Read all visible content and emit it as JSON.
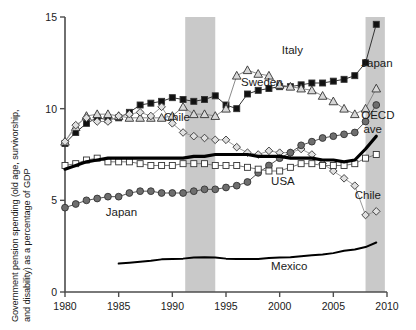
{
  "chart_data": {
    "type": "line",
    "title": "",
    "xlabel": "",
    "ylabel_line1": "Government pension spending (old age, survivorship,",
    "ylabel_line2": "and disability) as a percentage of GDP",
    "ylabel": "Government pension spending (old age, survivorship, and disability) as a percentage of GDP",
    "xlim": [
      1980,
      2010
    ],
    "ylim": [
      0,
      15
    ],
    "xticks": [
      1980,
      1985,
      1990,
      1995,
      2000,
      2005,
      2010
    ],
    "yticks": [
      0,
      5,
      10,
      15
    ],
    "xtick_labels": [
      "1980",
      "1985",
      "1990",
      "1995",
      "2000",
      "2005",
      "2010"
    ],
    "ytick_labels": [
      "0",
      "5",
      "10",
      "15"
    ],
    "grid": false,
    "legend": "inline-annotations",
    "shaded_bands": [
      {
        "label": "recession",
        "x0": 1991.2,
        "x1": 1994.0,
        "color": "#c9c9c9"
      },
      {
        "label": "recession",
        "x0": 2008.0,
        "x1": 2009.8,
        "color": "#c9c9c9"
      }
    ],
    "series": [
      {
        "name": "Italy",
        "marker": "filled-square",
        "marker_color": "#111111",
        "line_color": "#333333",
        "label_x": 2000.2,
        "label_y": 13.0,
        "x": [
          1980,
          1981,
          1982,
          1983,
          1984,
          1985,
          1986,
          1987,
          1988,
          1989,
          1990,
          1991,
          1992,
          1993,
          1994,
          1995,
          1996,
          1997,
          1998,
          1999,
          2000,
          2001,
          2002,
          2003,
          2004,
          2005,
          2006,
          2007,
          2008,
          2009
        ],
        "values": [
          8.1,
          8.7,
          9.2,
          9.5,
          9.4,
          9.5,
          9.8,
          10.2,
          10.3,
          10.4,
          10.6,
          10.5,
          10.4,
          10.5,
          10.7,
          10.2,
          10.0,
          10.8,
          11.0,
          11.1,
          11.2,
          11.2,
          11.3,
          11.4,
          11.4,
          11.5,
          11.6,
          11.8,
          12.5,
          14.6
        ]
      },
      {
        "name": "Sweden",
        "marker": "open-triangle",
        "marker_color": "#d7d7d7",
        "line_color": "#8a8a8a",
        "label_x": 1996.0,
        "label_y": 11.3,
        "x": [
          1980,
          1981,
          1982,
          1983,
          1984,
          1985,
          1986,
          1987,
          1988,
          1989,
          1990,
          1991,
          1992,
          1993,
          1994,
          1995,
          1996,
          1997,
          1998,
          1999,
          2000,
          2001,
          2002,
          2003,
          2004,
          2005,
          2006,
          2007,
          2008,
          2009
        ],
        "values": [
          8.2,
          9.0,
          9.6,
          9.7,
          9.7,
          9.6,
          9.5,
          9.5,
          9.5,
          9.5,
          9.6,
          10.1,
          9.7,
          9.7,
          9.6,
          10.0,
          11.8,
          12.1,
          11.9,
          11.8,
          11.3,
          11.2,
          11.1,
          11.0,
          10.7,
          10.4,
          10.0,
          9.7,
          10.0,
          11.1
        ]
      },
      {
        "name": "Chile",
        "marker": "open-diamond",
        "marker_color": "#e0e0e0",
        "line_color": "#9a9a9a",
        "label_x": 1989.0,
        "label_y": 9.4,
        "x": [
          1980,
          1981,
          1982,
          1983,
          1984,
          1985,
          1986,
          1987,
          1988,
          1989,
          1990,
          1991,
          1992,
          1993,
          1994,
          1995,
          1996,
          1997,
          1998,
          1999,
          2000,
          2001,
          2002,
          2003,
          2004,
          2005,
          2006,
          2007,
          2008,
          2009
        ],
        "values": [
          8.2,
          9.1,
          9.5,
          9.3,
          9.3,
          9.6,
          9.7,
          9.8,
          9.6,
          10.1,
          9.2,
          8.7,
          8.5,
          8.4,
          8.3,
          8.3,
          7.9,
          7.6,
          7.5,
          7.7,
          7.6,
          7.6,
          7.8,
          7.5,
          7.0,
          6.6,
          6.2,
          5.8,
          4.2,
          4.4
        ]
      },
      {
        "name": "Japan",
        "marker": "filled-circle",
        "marker_color": "#6e6e6e",
        "line_color": "#555555",
        "label_x": 1984.5,
        "label_y": 4.1,
        "label2_x": 2008.8,
        "label2_y": 12.0,
        "x": [
          1980,
          1981,
          1982,
          1983,
          1984,
          1985,
          1986,
          1987,
          1988,
          1989,
          1990,
          1991,
          1992,
          1993,
          1994,
          1995,
          1996,
          1997,
          1998,
          1999,
          2000,
          2001,
          2002,
          2003,
          2004,
          2005,
          2006,
          2007,
          2008,
          2009
        ],
        "values": [
          4.6,
          4.8,
          5.0,
          5.1,
          5.2,
          5.2,
          5.4,
          5.5,
          5.5,
          5.4,
          5.4,
          5.4,
          5.5,
          5.6,
          5.6,
          5.7,
          5.8,
          6.0,
          6.5,
          6.9,
          7.3,
          7.6,
          8.0,
          8.2,
          8.4,
          8.5,
          8.6,
          8.7,
          9.3,
          10.2
        ]
      },
      {
        "name": "USA",
        "marker": "open-square",
        "marker_color": "#ffffff",
        "line_color": "#7a7a7a",
        "label_x": 1999.0,
        "label_y": 5.9,
        "x": [
          1980,
          1981,
          1982,
          1983,
          1984,
          1985,
          1986,
          1987,
          1988,
          1989,
          1990,
          1991,
          1992,
          1993,
          1994,
          1995,
          1996,
          1997,
          1998,
          1999,
          2000,
          2001,
          2002,
          2003,
          2004,
          2005,
          2006,
          2007,
          2008,
          2009
        ],
        "values": [
          6.9,
          7.0,
          7.2,
          7.3,
          7.1,
          7.1,
          7.1,
          7.0,
          6.9,
          6.9,
          6.9,
          7.0,
          7.0,
          7.0,
          6.9,
          6.9,
          6.9,
          6.8,
          6.7,
          6.6,
          6.6,
          6.8,
          7.0,
          7.0,
          6.9,
          6.9,
          6.9,
          7.0,
          7.3,
          7.5
        ]
      },
      {
        "name": "OECD ave",
        "marker": "none",
        "marker_color": "#000000",
        "line_color": "#000000",
        "line_width": 3.2,
        "label_x": 2008.6,
        "label_y": 9.2,
        "x": [
          1980,
          1981,
          1982,
          1983,
          1984,
          1985,
          1986,
          1987,
          1988,
          1989,
          1990,
          1991,
          1992,
          1993,
          1994,
          1995,
          1996,
          1997,
          1998,
          1999,
          2000,
          2001,
          2002,
          2003,
          2004,
          2005,
          2006,
          2007,
          2008,
          2009
        ],
        "values": [
          6.7,
          6.9,
          7.1,
          7.2,
          7.3,
          7.3,
          7.3,
          7.3,
          7.3,
          7.3,
          7.3,
          7.3,
          7.4,
          7.4,
          7.5,
          7.5,
          7.5,
          7.5,
          7.4,
          7.4,
          7.4,
          7.3,
          7.3,
          7.3,
          7.2,
          7.2,
          7.1,
          7.2,
          7.8,
          8.5
        ]
      },
      {
        "name": "Mexico",
        "marker": "none",
        "marker_color": "#000000",
        "line_color": "#000000",
        "line_width": 2.0,
        "label_x": 2000.0,
        "label_y": 1.15,
        "x": [
          1985,
          1986,
          1987,
          1988,
          1989,
          1990,
          1991,
          1992,
          1993,
          1994,
          1995,
          1996,
          1997,
          1998,
          1999,
          2000,
          2001,
          2002,
          2003,
          2004,
          2005,
          2006,
          2007,
          2008,
          2009
        ],
        "values": [
          1.55,
          1.6,
          1.65,
          1.7,
          1.78,
          1.8,
          1.82,
          1.88,
          1.9,
          1.88,
          1.82,
          1.8,
          1.8,
          1.8,
          1.85,
          1.88,
          1.9,
          1.95,
          2.0,
          2.05,
          2.12,
          2.25,
          2.32,
          2.45,
          2.7
        ]
      }
    ],
    "annotations": [
      {
        "name": "label-italy",
        "text": "Italy",
        "x": 2000.2,
        "y": 13.0
      },
      {
        "name": "label-sweden",
        "text": "Sweden",
        "x": 1996.4,
        "y": 11.25
      },
      {
        "name": "label-chile-1",
        "text": "Chile",
        "x": 1989.2,
        "y": 9.35
      },
      {
        "name": "label-chile-2",
        "text": "Chile",
        "x": 2007.0,
        "y": 5.1
      },
      {
        "name": "label-japan-1",
        "text": "Japan",
        "x": 1983.8,
        "y": 4.15
      },
      {
        "name": "label-japan-2",
        "text": "Japan",
        "x": 2007.6,
        "y": 12.3
      },
      {
        "name": "label-usa",
        "text": "USA",
        "x": 1999.2,
        "y": 5.85
      },
      {
        "name": "label-oecd-1",
        "text": "OECD",
        "x": 2007.6,
        "y": 9.45
      },
      {
        "name": "label-oecd-2",
        "text": "ave",
        "x": 2007.8,
        "y": 8.65
      },
      {
        "name": "label-mexico",
        "text": "Mexico",
        "x": 1999.2,
        "y": 1.2
      }
    ]
  }
}
